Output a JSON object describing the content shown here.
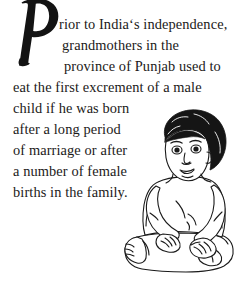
{
  "page": {
    "background_color": "#ffffff",
    "text_color": "#1c1a19"
  },
  "passage": {
    "dropcap": "P",
    "full_text": "Prior to India‘s independence, grandmothers in the province of Punjab used to eat the first excrement of a male child if he was born after a long period of marriage or after a number of female births in the family.",
    "lines": [
      "rior to India‘s independence,",
      "grandmothers in the",
      "province of Punjab used to",
      "eat the first excrement of a male",
      "child if he was born",
      "after a long period",
      "of marriage or after",
      "a number of female",
      "births in the family."
    ]
  },
  "illustration": {
    "name": "seated-baby-line-drawing",
    "description": "Line-art drawing of a seated infant with curly black hair, legs crossed, hands resting on legs",
    "ink_color": "#1a1a1a",
    "fill_color": "#ffffff"
  }
}
